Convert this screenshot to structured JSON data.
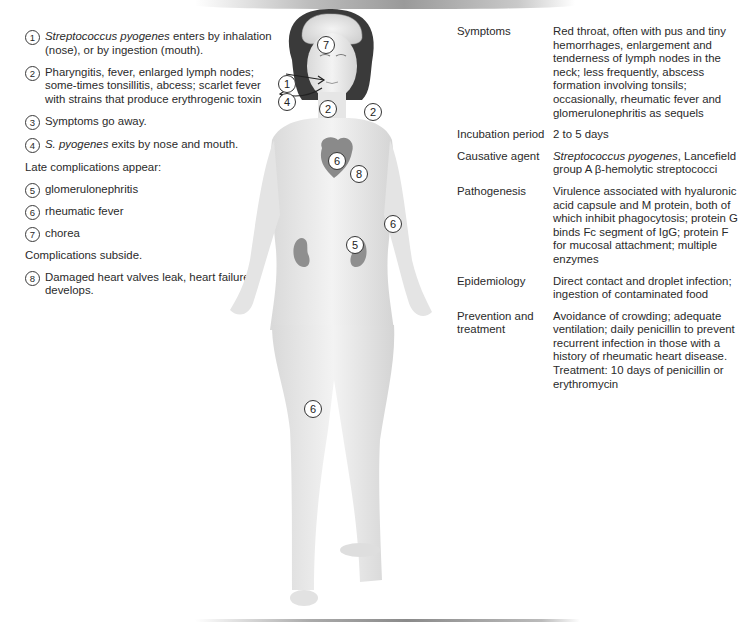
{
  "legend": {
    "items": [
      {
        "number": "1",
        "italic": "Streptococcus pyogenes",
        "text": " enters by inhalation (nose), or by ingestion (mouth)."
      },
      {
        "number": "2",
        "italic": "",
        "text": "Pharyngitis, fever, enlarged lymph nodes; some-times tonsillitis, abcess; scarlet fever with strains that produce erythrogenic toxin"
      },
      {
        "number": "3",
        "italic": "",
        "text": "Symptoms go away."
      },
      {
        "number": "4",
        "italic": "S. pyogenes",
        "text": " exits by nose and mouth."
      }
    ],
    "late_heading": "Late complications appear:",
    "late_items": [
      {
        "number": "5",
        "text": "glomerulonephritis"
      },
      {
        "number": "6",
        "text": "rheumatic fever"
      },
      {
        "number": "7",
        "text": "chorea"
      }
    ],
    "subside_heading": "Complications subside.",
    "final_items": [
      {
        "number": "8",
        "text": "Damaged heart valves leak, heart failure develops."
      }
    ]
  },
  "info_table": {
    "rows": [
      {
        "label": "Symptoms",
        "value": "Red throat, often with pus and tiny hemorrhages, enlargement and tenderness of lymph nodes in the neck; less frequently, abscess formation involving tonsils; occasionally, rheumatic fever and glomerulonephritis as sequels"
      },
      {
        "label": "Incubation period",
        "value": "2 to 5 days"
      },
      {
        "label": "Causative agent",
        "value_italic": "Streptococcus pyogenes",
        "value": ", Lancefield group A β-hemolytic streptococci"
      },
      {
        "label": "Pathogenesis",
        "value": "Virulence associated with hyaluronic acid capsule and M protein, both of which inhibit phagocytosis; protein G binds Fc segment of IgG; protein F for mucosal attachment; multiple enzymes"
      },
      {
        "label": "Epidemiology",
        "value": "Direct contact and droplet infection; ingestion of contaminated food"
      },
      {
        "label": "Prevention and treatment",
        "value": "Avoidance of crowding; adequate ventilation; daily penicillin to prevent recurrent infection in those with a history of rheumatic heart disease. Treatment: 10 days of penicillin or erythromycin"
      }
    ]
  },
  "figure": {
    "markers": [
      {
        "number": "7",
        "location": "brain"
      },
      {
        "number": "1",
        "location": "entry-nose-mouth"
      },
      {
        "number": "4",
        "location": "exit-nose-mouth"
      },
      {
        "number": "2",
        "location": "throat"
      },
      {
        "number": "2",
        "location": "neck-lymph-node"
      },
      {
        "number": "6",
        "location": "heart"
      },
      {
        "number": "8",
        "location": "heart-valves"
      },
      {
        "number": "6",
        "location": "elbow"
      },
      {
        "number": "5",
        "location": "kidney"
      },
      {
        "number": "6",
        "location": "knee"
      }
    ]
  }
}
